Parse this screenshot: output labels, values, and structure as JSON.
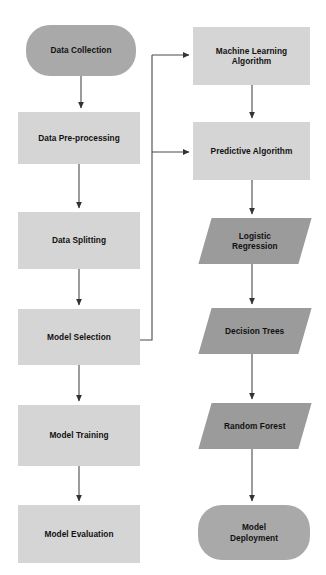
{
  "diagram": {
    "background_color": "#ffffff",
    "colors": {
      "rectangle_fill": "#d5d5d5",
      "capsule_fill": "#a9a9a9",
      "parallelogram_fill": "#9b9b9b",
      "edge_stroke": "#4a4a4a",
      "text_color": "#111111"
    },
    "nodes": [
      {
        "id": "data-collection",
        "label": "Data Collection",
        "shape": "capsule",
        "column": "left",
        "x": 26,
        "y": 25,
        "w": 110,
        "h": 51
      },
      {
        "id": "data-pre-processing",
        "label": "Data Pre-processing",
        "shape": "rectangle",
        "column": "left",
        "x": 18,
        "y": 112,
        "w": 122,
        "h": 52
      },
      {
        "id": "data-splitting",
        "label": "Data Splitting",
        "shape": "rectangle",
        "column": "left",
        "x": 18,
        "y": 212,
        "w": 122,
        "h": 57
      },
      {
        "id": "model-selection",
        "label": "Model Selection",
        "shape": "rectangle",
        "column": "left",
        "x": 18,
        "y": 309,
        "w": 122,
        "h": 56
      },
      {
        "id": "model-training",
        "label": "Model Training",
        "shape": "rectangle",
        "column": "left",
        "x": 18,
        "y": 405,
        "w": 122,
        "h": 61
      },
      {
        "id": "model-evaluation",
        "label": "Model Evaluation",
        "shape": "rectangle",
        "column": "left",
        "x": 18,
        "y": 505,
        "w": 122,
        "h": 58
      },
      {
        "id": "machine-learning-algorithm",
        "label": "Machine Learning\nAlgorithm",
        "shape": "rectangle",
        "column": "right",
        "x": 193,
        "y": 27,
        "w": 117,
        "h": 58
      },
      {
        "id": "predictive-algorithm",
        "label": "Predictive Algorithm",
        "shape": "rectangle",
        "column": "right",
        "x": 193,
        "y": 122,
        "w": 117,
        "h": 58
      },
      {
        "id": "logistic-regression",
        "label": "Logistic\nRegression",
        "shape": "parallelogram",
        "column": "right",
        "x": 205,
        "y": 218,
        "w": 100,
        "h": 46
      },
      {
        "id": "decision-trees",
        "label": "Decision Trees",
        "shape": "parallelogram",
        "column": "right",
        "x": 205,
        "y": 308,
        "w": 100,
        "h": 46
      },
      {
        "id": "random-forest",
        "label": "Random Forest",
        "shape": "parallelogram",
        "column": "right",
        "x": 205,
        "y": 403,
        "w": 100,
        "h": 46
      },
      {
        "id": "model-deployment",
        "label": "Model\nDeployment",
        "shape": "capsule",
        "column": "right",
        "x": 198,
        "y": 505,
        "w": 112,
        "h": 55
      }
    ],
    "edges": [
      {
        "id": "e1",
        "from": "data-collection",
        "to": "data-pre-processing",
        "type": "vertical-arrow"
      },
      {
        "id": "e2",
        "from": "data-pre-processing",
        "to": "data-splitting",
        "type": "vertical-arrow"
      },
      {
        "id": "e3",
        "from": "data-splitting",
        "to": "model-selection",
        "type": "vertical-arrow"
      },
      {
        "id": "e4",
        "from": "model-selection",
        "to": "model-training",
        "type": "vertical-arrow"
      },
      {
        "id": "e5",
        "from": "model-training",
        "to": "model-evaluation",
        "type": "vertical-arrow"
      },
      {
        "id": "e6",
        "from": "model-selection",
        "to": "machine-learning-algorithm",
        "type": "elbow-arrow"
      },
      {
        "id": "e7",
        "from": "model-selection",
        "to": "predictive-algorithm",
        "type": "elbow-arrow"
      },
      {
        "id": "e8",
        "from": "machine-learning-algorithm",
        "to": "predictive-algorithm",
        "type": "vertical-arrow"
      },
      {
        "id": "e9",
        "from": "predictive-algorithm",
        "to": "logistic-regression",
        "type": "vertical-arrow"
      },
      {
        "id": "e10",
        "from": "logistic-regression",
        "to": "decision-trees",
        "type": "vertical-arrow"
      },
      {
        "id": "e11",
        "from": "decision-trees",
        "to": "random-forest",
        "type": "vertical-arrow"
      },
      {
        "id": "e12",
        "from": "random-forest",
        "to": "model-deployment",
        "type": "vertical-arrow"
      }
    ]
  }
}
